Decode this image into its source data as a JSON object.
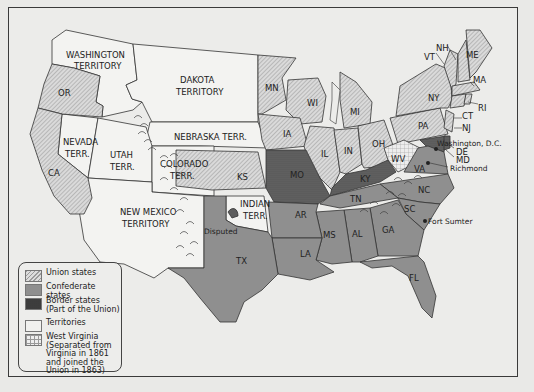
{
  "map": {
    "title": "",
    "colors": {
      "union": "#d2d2d2",
      "confederate": "#8f8f8f",
      "border": "#5e5e5e",
      "territory": "#f1f1ef",
      "west_virginia": "#e8e8e8",
      "background": "#ececea"
    },
    "territories": {
      "washington": "WASHINGTON",
      "washington2": "TERRITORY",
      "dakota": "DAKOTA",
      "dakota2": "TERRITORY",
      "nebraska": "NEBRASKA TERR.",
      "nevada": "NEVADA",
      "nevada2": "TERR.",
      "utah": "UTAH",
      "utah2": "TERR.",
      "colorado": "COLORADO",
      "colorado2": "TERR.",
      "new_mexico": "NEW MEXICO",
      "new_mexico2": "TERRITORY",
      "indian": "INDIAN",
      "indian2": "TERR."
    },
    "union_states": [
      "OR",
      "CA",
      "MN",
      "WI",
      "MI",
      "IA",
      "IL",
      "IN",
      "OH",
      "PA",
      "NY",
      "KS",
      "VT",
      "NH",
      "ME",
      "MA",
      "RI",
      "CT",
      "NJ"
    ],
    "border_states": [
      "MO",
      "KY",
      "MD",
      "DE"
    ],
    "confederate_states": [
      "TX",
      "AR",
      "LA",
      "MS",
      "AL",
      "TN",
      "GA",
      "SC",
      "NC",
      "FL",
      "VA"
    ],
    "labels": {
      "OR": "OR",
      "CA": "CA",
      "MN": "MN",
      "WI": "WI",
      "MI": "MI",
      "IA": "IA",
      "IL": "IL",
      "IN": "IN",
      "OH": "OH",
      "PA": "PA",
      "NY": "NY",
      "KS": "KS",
      "VT": "VT",
      "NH": "NH",
      "ME": "ME",
      "MA": "MA",
      "RI": "RI",
      "CT": "CT",
      "NJ": "NJ",
      "MO": "MO",
      "KY": "KY",
      "WV": "WV",
      "VA": "VA",
      "NC": "NC",
      "TN": "TN",
      "SC": "SC",
      "AR": "AR",
      "GA": "GA",
      "AL": "AL",
      "MS": "MS",
      "LA": "LA",
      "TX": "TX",
      "FL": "FL",
      "DE": "DE",
      "MD": "MD"
    },
    "places": {
      "washington_dc": "Washington, D.C.",
      "richmond": "Richmond",
      "fort_sumter": "Fort Sumter",
      "disputed": "Disputed"
    }
  },
  "legend": {
    "items": [
      {
        "key": "union",
        "label": "Union states"
      },
      {
        "key": "confederate",
        "label": "Confederate states"
      },
      {
        "key": "border",
        "label": "Border states",
        "sublabel": "(Part of the Union)"
      },
      {
        "key": "territory",
        "label": "Territories"
      },
      {
        "key": "west_virginia",
        "label": "West Virginia",
        "sublabel": "(Separated from",
        "sublabel2": "Virginia in 1861",
        "sublabel3": "and joined the",
        "sublabel4": "Union in 1863)"
      }
    ]
  }
}
